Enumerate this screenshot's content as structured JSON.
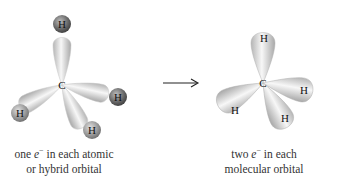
{
  "left_structure": {
    "center_atom": "C",
    "outer_atoms": [
      "H",
      "H",
      "H",
      "H"
    ],
    "caption_line1_pre": "one",
    "caption_electron": "e",
    "caption_charge": "−",
    "caption_line1_post": " in each atomic",
    "caption_line2": "or hybrid orbital"
  },
  "arrow": {
    "symbol": "→"
  },
  "right_structure": {
    "center_atom": "C",
    "outer_atoms": [
      "H",
      "H",
      "H",
      "H"
    ],
    "caption_line1_pre": "two",
    "caption_electron": "e",
    "caption_charge": "−",
    "caption_line1_post": " in each",
    "caption_line2": "molecular orbital"
  },
  "colors": {
    "lobe_light": "#f4f4f4",
    "lobe_dark": "#9a9a9a",
    "h_ball": "#5a5a5a"
  }
}
